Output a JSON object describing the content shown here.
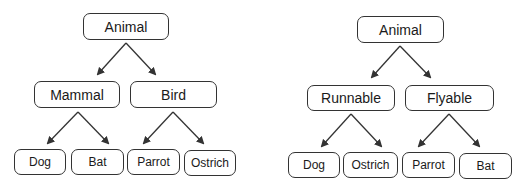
{
  "left_tree": {
    "root": "Animal",
    "level1": [
      "Mammal",
      "Bird"
    ],
    "leaves": [
      "Dog",
      "Bat",
      "Parrot",
      "Ostrich"
    ]
  },
  "right_tree": {
    "root": "Animal",
    "level1": [
      "Runnable",
      "Flyable"
    ],
    "leaves": [
      "Dog",
      "Ostrich",
      "Parrot",
      "Bat"
    ]
  },
  "colors": {
    "line": "#333333",
    "background": "#ffffff"
  }
}
